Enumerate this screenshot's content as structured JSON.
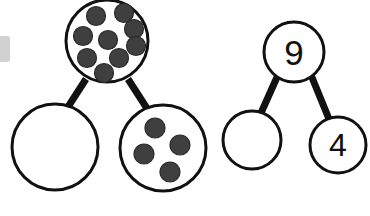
{
  "page": {
    "background_color": "#ffffff",
    "width": 370,
    "height": 216
  },
  "style": {
    "circle_fill": "#ffffff",
    "circle_stroke": "#111111",
    "circle_stroke_width": 3,
    "connector_color": "#111111",
    "connector_width": 7,
    "counter_fill": "#3f3f3f",
    "counter_stroke": "#2a2a2a",
    "numeral_color": "#111111"
  },
  "diagrams": [
    {
      "id": "pictorial-number-bond",
      "name": "pictorial-number-bond",
      "whole": {
        "id": "whole-counters",
        "label": "",
        "kind": "counters",
        "count": 9,
        "cx": 107,
        "cy": 41,
        "r": 41,
        "counter_r": 9.5,
        "counters": [
          {
            "cx": 96,
            "cy": 16
          },
          {
            "cx": 124,
            "cy": 13
          },
          {
            "cx": 134,
            "cy": 29
          },
          {
            "cx": 83,
            "cy": 36
          },
          {
            "cx": 108,
            "cy": 40
          },
          {
            "cx": 136,
            "cy": 46
          },
          {
            "cx": 87,
            "cy": 58
          },
          {
            "cx": 119,
            "cy": 58
          },
          {
            "cx": 104,
            "cy": 73
          }
        ]
      },
      "parts": [
        {
          "id": "part-empty-left",
          "label": "",
          "kind": "empty",
          "count": 0,
          "cx": 55,
          "cy": 147,
          "r": 43,
          "counters": []
        },
        {
          "id": "part-counters-right",
          "label": "",
          "kind": "counters",
          "count": 4,
          "cx": 163,
          "cy": 148,
          "r": 43,
          "counter_r": 10,
          "counters": [
            {
              "cx": 155,
              "cy": 128
            },
            {
              "cx": 180,
              "cy": 145
            },
            {
              "cx": 144,
              "cy": 154
            },
            {
              "cx": 170,
              "cy": 172
            }
          ]
        }
      ],
      "connectors": [
        {
          "id": "connector-whole-to-left",
          "x1": 86,
          "y1": 79,
          "x2": 66,
          "y2": 110
        },
        {
          "id": "connector-whole-to-right",
          "x1": 128,
          "y1": 79,
          "x2": 148,
          "y2": 110
        }
      ]
    },
    {
      "id": "numeric-number-bond",
      "name": "numeric-number-bond",
      "whole": {
        "id": "whole-nine",
        "label": "9",
        "kind": "numeral",
        "count": 9,
        "cx": 294,
        "cy": 52,
        "r": 30,
        "counters": []
      },
      "parts": [
        {
          "id": "part-empty-blank",
          "label": "",
          "kind": "empty",
          "count": 0,
          "cx": 252,
          "cy": 140,
          "r": 29,
          "counters": []
        },
        {
          "id": "part-four",
          "label": "4",
          "kind": "numeral",
          "count": 4,
          "cx": 338,
          "cy": 145,
          "r": 28,
          "counters": []
        }
      ],
      "connectors": [
        {
          "id": "connector-nine-to-blank",
          "x1": 278,
          "y1": 75,
          "x2": 261,
          "y2": 113
        },
        {
          "id": "connector-nine-to-four",
          "x1": 311,
          "y1": 75,
          "x2": 329,
          "y2": 119
        }
      ]
    }
  ],
  "artifacts": [
    {
      "id": "left-edge-smudge",
      "name": "left-edge-smudge",
      "color": "#c9c9c9"
    }
  ]
}
